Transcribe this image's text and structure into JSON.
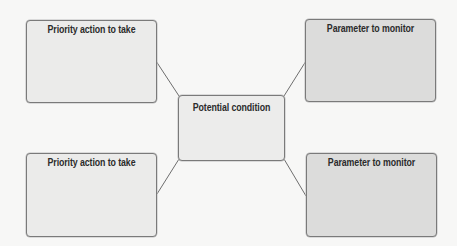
{
  "diagram": {
    "type": "concept-map",
    "center": {
      "label": "Potential condition"
    },
    "nodes": [
      {
        "position": "top-left",
        "label": "Priority action to take"
      },
      {
        "position": "top-right",
        "label": "Parameter to monitor"
      },
      {
        "position": "bottom-left",
        "label": "Priority action to take"
      },
      {
        "position": "bottom-right",
        "label": "Parameter to monitor"
      }
    ],
    "colors": {
      "background": "#f7f7f6",
      "left_box_fill": "#ebebea",
      "right_box_fill": "#dcdcdb",
      "center_box_fill": "#ececeb",
      "border": "#7a7a7a",
      "connector": "#6e6e6e",
      "text": "#2b2b2b"
    }
  }
}
